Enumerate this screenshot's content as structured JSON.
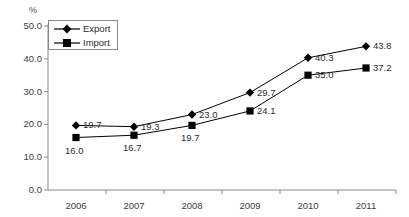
{
  "chart_data": {
    "type": "line",
    "title": "",
    "xlabel": "",
    "ylabel": "%",
    "categories": [
      "2006",
      "2007",
      "2008",
      "2009",
      "2010",
      "2011"
    ],
    "ylim": [
      0.0,
      50.0
    ],
    "yticks": [
      "0.0",
      "10.0",
      "20.0",
      "30.0",
      "40.0",
      "50.0"
    ],
    "ytick_values": [
      0.0,
      10.0,
      20.0,
      30.0,
      40.0,
      50.0
    ],
    "grid": false,
    "legend_position": "upper-left",
    "series": [
      {
        "name": "Export",
        "marker": "diamond",
        "color": "#000000",
        "values": [
          19.7,
          19.3,
          23.0,
          29.7,
          40.3,
          43.8
        ],
        "labels": [
          "19.7",
          "19.3",
          "23.0",
          "29.7",
          "40.3",
          "43.8"
        ]
      },
      {
        "name": "Import",
        "marker": "square",
        "color": "#000000",
        "values": [
          16.0,
          16.7,
          19.7,
          24.1,
          35.0,
          37.2
        ],
        "labels": [
          "16.0",
          "16.7",
          "19.7",
          "24.1",
          "35.0",
          "37.2"
        ]
      }
    ]
  },
  "axes": {
    "unit_label": "%",
    "axis_color": "#808080",
    "text_color": "#3d3d3d"
  },
  "legend": {
    "entries": [
      {
        "label": "Export",
        "marker": "diamond"
      },
      {
        "label": "Import",
        "marker": "square"
      }
    ]
  }
}
